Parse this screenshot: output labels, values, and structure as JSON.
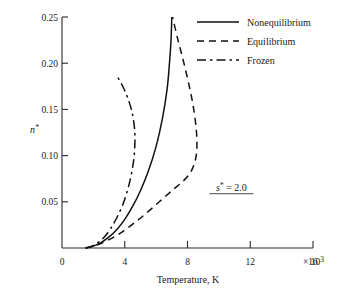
{
  "chart_data": {
    "type": "line",
    "title": "",
    "xlabel": "Temperature, K",
    "ylabel": "n*",
    "x_exponent_label": "16 × 10³",
    "xlim": [
      0,
      16000
    ],
    "ylim": [
      0,
      0.25
    ],
    "grid": false,
    "legend_position": "top-right",
    "x_ticks": [
      0,
      4000,
      8000,
      12000,
      16000
    ],
    "x_tick_labels": [
      "0",
      "4",
      "8",
      "12",
      "16"
    ],
    "y_ticks": [
      0.05,
      0.1,
      0.15,
      0.2,
      0.25
    ],
    "y_tick_labels": [
      "0.05",
      "0.10",
      "0.15",
      "0.20",
      "0.25"
    ],
    "annotations": [
      {
        "text": "s* = 2.0",
        "x": 10800,
        "y": 0.062,
        "underlined": true
      }
    ],
    "series": [
      {
        "name": "Nonequilibrium",
        "style": "solid",
        "points": [
          [
            1500,
            0.0
          ],
          [
            2000,
            0.002
          ],
          [
            2500,
            0.006
          ],
          [
            3000,
            0.012
          ],
          [
            3500,
            0.02
          ],
          [
            4000,
            0.031
          ],
          [
            4500,
            0.045
          ],
          [
            5000,
            0.062
          ],
          [
            5500,
            0.083
          ],
          [
            6000,
            0.11
          ],
          [
            6400,
            0.14
          ],
          [
            6700,
            0.172
          ],
          [
            6850,
            0.2
          ],
          [
            6950,
            0.225
          ],
          [
            7000,
            0.25
          ]
        ]
      },
      {
        "name": "Equilibrium",
        "style": "dashed",
        "points": [
          [
            1500,
            0.0
          ],
          [
            2200,
            0.003
          ],
          [
            3000,
            0.009
          ],
          [
            3800,
            0.017
          ],
          [
            4600,
            0.027
          ],
          [
            5400,
            0.038
          ],
          [
            6200,
            0.05
          ],
          [
            7000,
            0.062
          ],
          [
            7700,
            0.072
          ],
          [
            8200,
            0.082
          ],
          [
            8500,
            0.095
          ],
          [
            8600,
            0.11
          ],
          [
            8550,
            0.13
          ],
          [
            8350,
            0.155
          ],
          [
            8050,
            0.18
          ],
          [
            7700,
            0.205
          ],
          [
            7350,
            0.228
          ],
          [
            7050,
            0.25
          ]
        ]
      },
      {
        "name": "Frozen",
        "style": "dash-dot",
        "points": [
          [
            1500,
            0.0
          ],
          [
            1900,
            0.002
          ],
          [
            2300,
            0.006
          ],
          [
            2700,
            0.012
          ],
          [
            3100,
            0.021
          ],
          [
            3500,
            0.033
          ],
          [
            3900,
            0.048
          ],
          [
            4200,
            0.064
          ],
          [
            4450,
            0.082
          ],
          [
            4600,
            0.1
          ],
          [
            4650,
            0.118
          ],
          [
            4600,
            0.133
          ],
          [
            4450,
            0.148
          ],
          [
            4200,
            0.162
          ],
          [
            3900,
            0.174
          ],
          [
            3550,
            0.185
          ]
        ]
      }
    ]
  },
  "legend": {
    "items": [
      {
        "label": "Nonequilibrium",
        "style": "solid"
      },
      {
        "label": "Equilibrium",
        "style": "dashed"
      },
      {
        "label": "Frozen",
        "style": "dash-dot"
      }
    ]
  }
}
